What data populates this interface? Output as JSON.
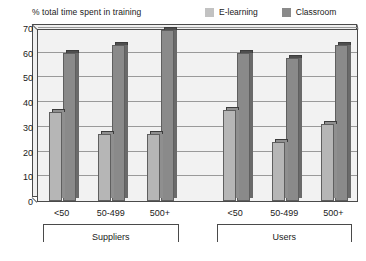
{
  "chart_data": {
    "type": "bar",
    "title": "",
    "subtitle": "",
    "xlabel": "",
    "ylabel": "% total time spent in training",
    "ylim": [
      0,
      70
    ],
    "ytick_step": 10,
    "yticks": [
      70,
      60,
      50,
      40,
      30,
      20,
      10,
      0
    ],
    "grid": true,
    "legend_position": "top-right",
    "categories": [
      "<50",
      "50-499",
      "500+",
      "<50",
      "50-499",
      "500+"
    ],
    "groups": [
      {
        "label": "Suppliers",
        "categories": [
          "<50",
          "50-499",
          "500+"
        ]
      },
      {
        "label": "Users",
        "categories": [
          "<50",
          "50-499",
          "500+"
        ]
      }
    ],
    "series": [
      {
        "name": "E-learning",
        "color": "#b6b6b6",
        "values": [
          36,
          27,
          27,
          37,
          24,
          31
        ]
      },
      {
        "name": "Classroom",
        "color": "#8a8a8a",
        "values": [
          60,
          63,
          69,
          60,
          58,
          63
        ]
      }
    ]
  },
  "legend": {
    "items": [
      {
        "label": "E-learning",
        "swatch": "light"
      },
      {
        "label": "Classroom",
        "swatch": "dark"
      }
    ]
  },
  "axis": {
    "caption": "% total time spent in training"
  },
  "colors": {
    "elearning": "#b6b6b6",
    "classroom": "#8a8a8a",
    "plot_background": "#f2f2f2",
    "gridline": "#9a9a9a",
    "axis_line": "#4a4a4a"
  }
}
